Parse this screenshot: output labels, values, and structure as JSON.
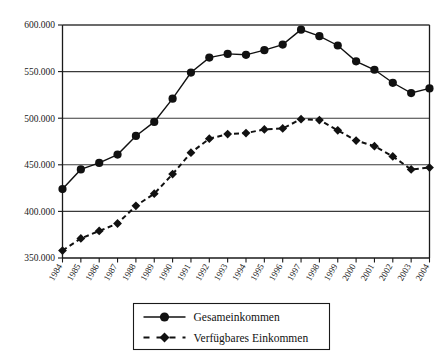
{
  "chart_data": {
    "type": "line",
    "title": "",
    "subtitle": "",
    "xlabel": "",
    "ylabel": "",
    "x": [
      1984,
      1985,
      1986,
      1987,
      1988,
      1989,
      1990,
      1991,
      1992,
      1993,
      1994,
      1995,
      1996,
      1997,
      1998,
      1999,
      2000,
      2001,
      2002,
      2003,
      2004
    ],
    "categories": [
      "1984",
      "1985",
      "1986",
      "1987",
      "1988",
      "1989",
      "1990",
      "1991",
      "1992",
      "1993",
      "1994",
      "1995",
      "1996",
      "1997",
      "1998",
      "1999",
      "2000",
      "2001",
      "2002",
      "2003",
      "2004"
    ],
    "series": [
      {
        "name": "Gesameinkommen",
        "marker": "circle",
        "linestyle": "solid",
        "color": "#111111",
        "values": [
          424000,
          445000,
          452000,
          461000,
          481000,
          496000,
          521000,
          549000,
          565000,
          569000,
          568000,
          573000,
          579000,
          595000,
          588000,
          578000,
          561000,
          552000,
          538000,
          527000,
          532000
        ]
      },
      {
        "name": "Verfügbares Einkommen",
        "marker": "diamond",
        "linestyle": "dashed",
        "color": "#111111",
        "values": [
          358000,
          371000,
          379000,
          387000,
          406000,
          419000,
          440000,
          463000,
          478000,
          483000,
          484000,
          488000,
          489000,
          499000,
          498000,
          487000,
          476000,
          470000,
          459000,
          445000,
          447000
        ]
      }
    ],
    "ylim": [
      350000,
      600000
    ],
    "yticks": [
      350000,
      400000,
      450000,
      500000,
      550000,
      600000
    ],
    "ytick_labels": [
      "350.000",
      "400.000",
      "450.000",
      "500.000",
      "550.000",
      "600.000"
    ],
    "grid": true,
    "grid_axis": "y",
    "legend_position": "bottom-center",
    "annotations": []
  },
  "legend": {
    "entries": [
      {
        "label": "Gesameinkommen",
        "marker": "circle-marker",
        "linestyle": "solid"
      },
      {
        "label": "Verfügbares Einkommen",
        "marker": "diamond-marker",
        "linestyle": "dashed"
      }
    ]
  },
  "colors": {
    "series": "#111111",
    "gridline": "#3a3a3a",
    "axis": "#1a1a1a",
    "background": "#ffffff"
  }
}
